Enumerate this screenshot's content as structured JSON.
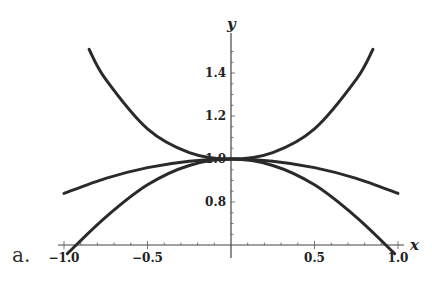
{
  "panel_label": "a.",
  "chart_data": {
    "type": "line",
    "title": "",
    "xlabel": "x",
    "ylabel": "y",
    "xlim": [
      -1.0,
      1.0
    ],
    "ylim": [
      0.6,
      1.55
    ],
    "x_axis_crosses_y_at": 0.6,
    "grid": false,
    "legend": null,
    "x_ticks": [
      -1.0,
      -0.5,
      0.5,
      1.0
    ],
    "x_tick_labels": [
      "-1.0",
      "-0.5",
      "0.5",
      "1.0"
    ],
    "y_ticks": [
      0.8,
      1.0,
      1.2,
      1.4
    ],
    "y_tick_labels": [
      "0.8",
      "1.0",
      "1.2",
      "1.4"
    ],
    "series": [
      {
        "name": "upper curve (approx. sec x)",
        "x": [
          -0.85,
          -0.75,
          -0.5,
          -0.25,
          0,
          0.25,
          0.5,
          0.75,
          0.85
        ],
        "values": [
          1.51,
          1.37,
          1.14,
          1.03,
          1.0,
          1.03,
          1.14,
          1.37,
          1.51
        ]
      },
      {
        "name": "middle curve (approx. sin x / x)",
        "x": [
          -1.0,
          -0.75,
          -0.5,
          -0.25,
          0,
          0.25,
          0.5,
          0.75,
          1.0
        ],
        "values": [
          0.84,
          0.91,
          0.96,
          0.99,
          1.0,
          0.99,
          0.96,
          0.91,
          0.84
        ]
      },
      {
        "name": "lower curve (approx. cos x)",
        "x": [
          -0.98,
          -0.75,
          -0.5,
          -0.25,
          0,
          0.25,
          0.5,
          0.75,
          0.98
        ],
        "values": [
          0.56,
          0.73,
          0.88,
          0.97,
          1.0,
          0.97,
          0.88,
          0.73,
          0.56
        ]
      }
    ]
  }
}
